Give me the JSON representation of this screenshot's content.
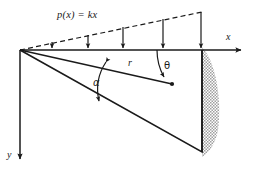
{
  "figure": {
    "background_color": "#ffffff",
    "ink_color": "#1a1a1a",
    "hatch_color": "#8c8c8c",
    "labels": {
      "load_function": "p(x) = kx",
      "x_axis": "x",
      "y_axis": "y",
      "radius": "r",
      "alpha": "α",
      "theta": "θ"
    },
    "geometry": {
      "origin": [
        20,
        50
      ],
      "x_axis_end": [
        245,
        50
      ],
      "y_axis_end": [
        20,
        163
      ],
      "wall_top": [
        202,
        50
      ],
      "wall_bottom": [
        202,
        152
      ],
      "wedge_apex": [
        20,
        50
      ],
      "wedge_lower_vertex": [
        202,
        152
      ],
      "load_line_start": [
        20,
        50
      ],
      "load_line_end": [
        202,
        12
      ],
      "radius_line_start": [
        20,
        50
      ],
      "radius_point": [
        172,
        84
      ]
    },
    "load_arrows": [
      {
        "x": 52,
        "top": 42,
        "bottom": 50
      },
      {
        "x": 88,
        "top": 35,
        "bottom": 50
      },
      {
        "x": 123,
        "top": 27,
        "bottom": 50
      },
      {
        "x": 163,
        "top": 19,
        "bottom": 50
      },
      {
        "x": 201,
        "top": 12,
        "bottom": 50
      }
    ],
    "label_positions": {
      "load_function": {
        "left": 57,
        "top": 10
      },
      "x_axis": {
        "left": 226,
        "top": 33
      },
      "y_axis": {
        "left": 7,
        "top": 151
      },
      "radius": {
        "left": 128,
        "top": 59
      },
      "alpha": {
        "left": 93,
        "top": 79
      },
      "theta": {
        "left": 163,
        "top": 62
      }
    }
  }
}
